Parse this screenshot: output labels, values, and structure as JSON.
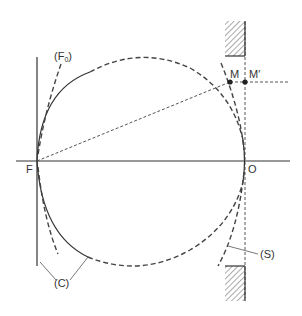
{
  "diagram": {
    "labels": {
      "F0": "(F",
      "F0_sub": "0",
      "F0_close": ")",
      "M": "M",
      "M_prime": "M′",
      "F": "F",
      "O": "O",
      "S": "(S)",
      "C": "(C)"
    },
    "colors": {
      "line": "#333333",
      "hatch": "#555555",
      "background": "#ffffff"
    }
  }
}
